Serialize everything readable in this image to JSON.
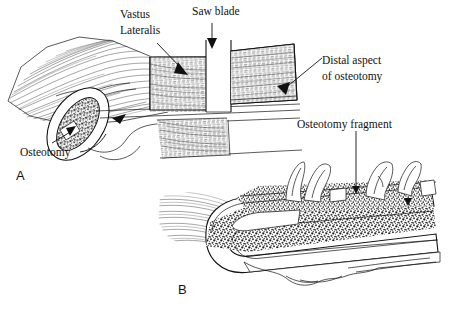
{
  "figure": {
    "background_color": "#ffffff",
    "ink_color": "#111111",
    "panels": [
      {
        "letter": "A",
        "description": "Lateral view of femur with vastus lateralis, saw blade performing osteotomy cut"
      },
      {
        "letter": "B",
        "description": "Osteotomy fragment reflected away from femoral shaft with attached muscle"
      }
    ]
  },
  "labels": {
    "vastus_lateralis": "Vastus\nLateralis",
    "vastus_lateralis_line1": "Vastus",
    "vastus_lateralis_line2": "Lateralis",
    "saw_blade": "Saw blade",
    "distal_aspect_line1": "Distal aspect",
    "distal_aspect_line2": "of osteotomy",
    "osteotomy": "Osteotomy",
    "osteotomy_fragment": "Osteotomy fragment",
    "panel_a": "A",
    "panel_b": "B"
  },
  "anatomy": {
    "cancellous_bone_fill": "#3a3a3a",
    "cortical_bone_fill": "#ffffff",
    "muscle_hatch_color": "#2a2a2a",
    "structures": [
      "vastus lateralis muscle",
      "femoral shaft",
      "osteotomy fragment",
      "cancellous bone",
      "cortical bone rim",
      "saw blade kerf"
    ]
  }
}
